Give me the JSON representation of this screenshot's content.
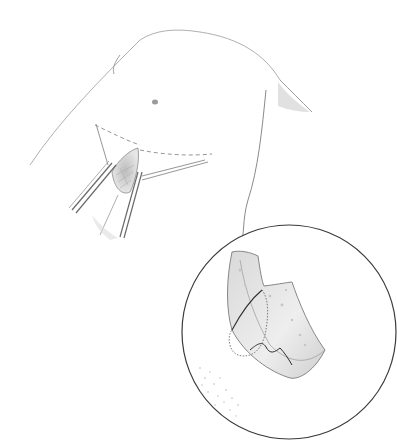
{
  "figure": {
    "kind": "surgical-illustration",
    "style": "pencil drawing",
    "colors": {
      "background": "#ffffff",
      "line": "#8a8a8a",
      "dark_line": "#4a4a4a",
      "shade": "#c8c8c8"
    },
    "main_view": {
      "subject": "lower abdomen with incision retracted by instruments",
      "elements": [
        "torso-outline",
        "umbilicus",
        "dashed-incision-lines",
        "retractor-left",
        "retractor-right",
        "exposed-tissue"
      ]
    },
    "inset": {
      "shape": "circle",
      "center": [
        289,
        332
      ],
      "radius": 107,
      "subject": "magnified tissue flap with suture line",
      "elements": [
        "tissue-flap",
        "suture-line",
        "dotted-outline",
        "stippled-skin"
      ]
    }
  }
}
